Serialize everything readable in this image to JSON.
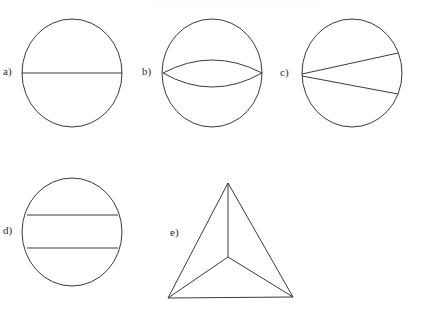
{
  "page": {
    "background_color": "#ffffff",
    "width": 427,
    "height": 313,
    "stroke_color": "#3a3a3a",
    "label_color": "#2b2b2b"
  },
  "figures": [
    {
      "id": "a",
      "label": "a)",
      "label_x": 9,
      "label_y": 72,
      "shape": "circle-with-horizontal-diameter",
      "description": "Circle divided by a single horizontal diameter into two equal halves",
      "circle": {
        "cx": 72,
        "cy": 73,
        "rx": 50,
        "ry": 54
      },
      "lines": [
        {
          "name": "horizontal-diameter",
          "x1": 22,
          "y1": 73,
          "x2": 122,
          "y2": 73
        }
      ],
      "arcs": [],
      "regions": 2
    },
    {
      "id": "b",
      "label": "b)",
      "label_x": 148,
      "label_y": 72,
      "shape": "circle-with-lens-arcs",
      "description": "Circle with two arcs meeting at left and right points forming a lens (vesica) shape",
      "circle": {
        "cx": 212,
        "cy": 73,
        "rx": 50,
        "ry": 54
      },
      "lines": [],
      "arcs": [
        {
          "name": "upper-lens-arc",
          "x1": 163,
          "y1": 73,
          "cx": 212,
          "cy": 47,
          "x2": 262,
          "y2": 73
        },
        {
          "name": "lower-lens-arc",
          "x1": 163,
          "y1": 73,
          "cx": 212,
          "cy": 101,
          "x2": 262,
          "y2": 73
        }
      ],
      "regions": 3
    },
    {
      "id": "c",
      "label": "c)",
      "label_x": 286,
      "label_y": 73,
      "shape": "circle-with-two-chords-from-point",
      "description": "Circle with two straight chords radiating from a left point to the upper right and lower right of the circumference",
      "circle": {
        "cx": 352,
        "cy": 73,
        "rx": 50,
        "ry": 54
      },
      "lines": [
        {
          "name": "upper-chord",
          "x1": 302,
          "y1": 74,
          "x2": 398,
          "y2": 53
        },
        {
          "name": "lower-chord",
          "x1": 302,
          "y1": 76,
          "x2": 398,
          "y2": 94
        }
      ],
      "arcs": [],
      "regions": 3
    },
    {
      "id": "d",
      "label": "d)",
      "label_x": 9,
      "label_y": 231,
      "shape": "circle-with-two-parallel-horizontal-chords",
      "description": "Circle divided by two horizontal parallel chords into three bands",
      "circle": {
        "cx": 72,
        "cy": 232,
        "rx": 50,
        "ry": 54
      },
      "lines": [
        {
          "name": "upper-chord",
          "x1": 27,
          "y1": 215,
          "x2": 118,
          "y2": 215
        },
        {
          "name": "lower-chord",
          "x1": 27,
          "y1": 248,
          "x2": 118,
          "y2": 248
        }
      ],
      "arcs": [],
      "regions": 3
    },
    {
      "id": "e",
      "label": "e)",
      "label_x": 176,
      "label_y": 233,
      "shape": "triangle-with-center-spokes",
      "description": "Triangle with an interior center point connected by three spokes to each vertex, dividing it into three regions",
      "triangle": {
        "apex": {
          "x": 228,
          "y": 183
        },
        "bottom_left": {
          "x": 168,
          "y": 298
        },
        "bottom_right": {
          "x": 293,
          "y": 297
        }
      },
      "center_point": {
        "x": 228,
        "y": 257
      },
      "lines": [
        {
          "name": "spoke-to-apex",
          "x1": 228,
          "y1": 257,
          "x2": 228,
          "y2": 183
        },
        {
          "name": "spoke-to-bottom-left",
          "x1": 228,
          "y1": 257,
          "x2": 168,
          "y2": 298
        },
        {
          "name": "spoke-to-bottom-right",
          "x1": 228,
          "y1": 257,
          "x2": 293,
          "y2": 297
        }
      ],
      "arcs": [],
      "regions": 3
    }
  ]
}
